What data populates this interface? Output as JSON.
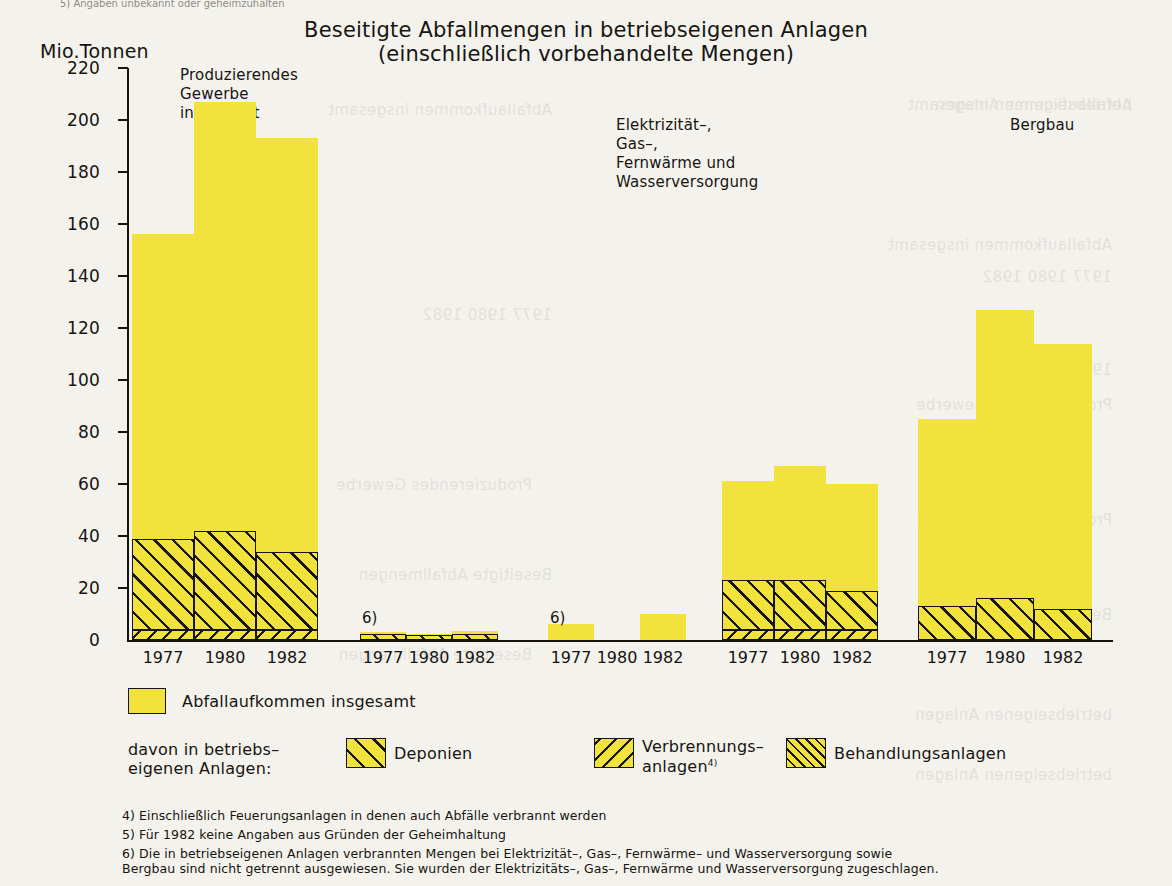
{
  "page": {
    "top_note": "5) Angaben unbekannt oder geheimzuhalten",
    "bleed_lines": [
      "Abfallaufkommen insgesamt",
      "1977  1980  1982",
      "Produzierendes Gewerbe",
      "Beseitigte Abfallmengen",
      "betriebseigenen Anlagen"
    ]
  },
  "chart_data": {
    "type": "bar",
    "title": "Beseitigte Abfallmengen in betriebseigenen Anlagen",
    "subtitle": "(einschließlich vorbehandelte Mengen)",
    "ylabel": "Mio.Tonnen",
    "xlabel": "",
    "ylim": [
      0,
      220
    ],
    "yticks": [
      0,
      20,
      40,
      60,
      80,
      100,
      120,
      140,
      160,
      180,
      200,
      220
    ],
    "ytick_labels": [
      "0",
      "20",
      "40",
      "60",
      "80",
      "100",
      "120",
      "140",
      "160",
      "180",
      "200",
      "220"
    ],
    "grid": false,
    "legend_position": "below",
    "x": [
      "1977",
      "1980",
      "1982"
    ],
    "series": [
      {
        "name": "Abfallaufkommen insgesamt",
        "key": "total",
        "pattern": "solid-yellow"
      },
      {
        "name": "Deponien",
        "key": "deponien",
        "pattern": "hatch-45"
      },
      {
        "name": "Verbrennungsanlagen",
        "key": "verbrennung",
        "pattern": "hatch-135"
      },
      {
        "name": "Behandlungsanlagen",
        "key": "behandlung",
        "pattern": "hatch-45-dense"
      }
    ],
    "groups": [
      {
        "label": "Produzierendes\nGewerbe insgesamt",
        "footnote_mark": "",
        "bars": [
          {
            "year": "1977",
            "total": 156,
            "deponien": 35,
            "verbrennung": 4,
            "behandlung": 0
          },
          {
            "year": "1980",
            "total": 207,
            "deponien": 38,
            "verbrennung": 4,
            "behandlung": 0
          },
          {
            "year": "1982",
            "total": 193,
            "deponien": 30,
            "verbrennung": 4,
            "behandlung": 0
          }
        ]
      },
      {
        "label": "Elektrizität–, Gas–,\nFernwärme und\nWasserversorgung",
        "footnote_mark": "6)",
        "bars": [
          {
            "year": "1977",
            "total": 3,
            "deponien": 2.5,
            "verbrennung": 0,
            "behandlung": 0
          },
          {
            "year": "1980",
            "total": 2.5,
            "deponien": 2,
            "verbrennung": 0,
            "behandlung": 0
          },
          {
            "year": "1982",
            "total": 3.5,
            "deponien": 2.5,
            "verbrennung": 0,
            "behandlung": 0
          }
        ]
      },
      {
        "label": "Bergbau",
        "footnote_mark": "6)",
        "bars": [
          {
            "year": "1977",
            "total": 6,
            "deponien": 0,
            "verbrennung": 0,
            "behandlung": 0
          },
          {
            "year": "1980",
            "total": 0,
            "deponien": 0,
            "verbrennung": 0,
            "behandlung": 0
          },
          {
            "year": "1982",
            "total": 10,
            "deponien": 0,
            "verbrennung": 0,
            "behandlung": 0
          }
        ]
      },
      {
        "label": "Verarbeitendes\nGewerbe",
        "footnote_mark": "",
        "bars": [
          {
            "year": "1977",
            "total": 61,
            "deponien": 19,
            "verbrennung": 4,
            "behandlung": 0
          },
          {
            "year": "1980",
            "total": 67,
            "deponien": 19,
            "verbrennung": 4,
            "behandlung": 0
          },
          {
            "year": "1982",
            "total": 60,
            "deponien": 15,
            "verbrennung": 4,
            "behandlung": 0
          }
        ]
      },
      {
        "label": "Baugewerbe",
        "footnote_mark": "",
        "bars": [
          {
            "year": "1977",
            "total": 85,
            "deponien": 13,
            "verbrennung": 0,
            "behandlung": 0
          },
          {
            "year": "1980",
            "total": 127,
            "deponien": 16,
            "verbrennung": 0,
            "behandlung": 0
          },
          {
            "year": "1982",
            "total": 114,
            "deponien": 12,
            "verbrennung": 0,
            "behandlung": 0
          }
        ]
      }
    ],
    "colors": {
      "fill": "#f2e23c",
      "ink": "#17140f",
      "paper": "#f4f2ed"
    }
  },
  "legend": {
    "total_label": "Abfallaufkommen insgesamt",
    "sub_label": "davon in betriebs–\neigenen Anlagen:",
    "items": [
      {
        "label": "Deponien",
        "sup": ""
      },
      {
        "label": "Verbrennungs–\nanlagen",
        "sup": "4)"
      },
      {
        "label": "Behandlungsanlagen",
        "sup": ""
      }
    ]
  },
  "footnotes": [
    "4) Einschließlich Feuerungsanlagen in denen auch Abfälle verbrannt werden",
    "5) Für 1982 keine Angaben aus Gründen der Geheimhaltung",
    "6) Die in betriebseigenen Anlagen verbrannten Mengen bei Elektrizität–, Gas–, Fernwärme– und Wasserversorgung sowie\n    Bergbau sind nicht getrennt ausgewiesen. Sie wurden der Elektrizitäts–, Gas–, Fernwärme und Wasserversorgung zugeschlagen."
  ]
}
